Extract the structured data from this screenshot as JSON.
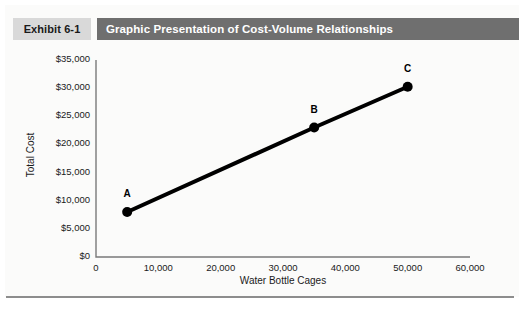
{
  "exhibit": {
    "tag": "Exhibit 6-1",
    "title": "Graphic Presentation of Cost-Volume Relationships"
  },
  "colors": {
    "panel_background": "#fbfbfa",
    "tag_background": "#d9d9d9",
    "title_background": "#6f6f6f",
    "title_text": "#ffffff",
    "axis_line": "#7a7a7a",
    "series_line": "#000000",
    "marker": "#000000",
    "bottom_rule": "#8d8d8d"
  },
  "chart_data": {
    "type": "line",
    "title": "Graphic Presentation of Cost-Volume Relationships",
    "xlabel": "Water Bottle Cages",
    "ylabel": "Total Cost",
    "xlim": [
      0,
      60000
    ],
    "ylim": [
      0,
      35000
    ],
    "xticks": [
      0,
      10000,
      20000,
      30000,
      40000,
      50000,
      60000
    ],
    "xtick_labels": [
      "0",
      "10,000",
      "20,000",
      "30,000",
      "40,000",
      "50,000",
      "60,000"
    ],
    "yticks": [
      0,
      5000,
      10000,
      15000,
      20000,
      25000,
      30000,
      35000
    ],
    "ytick_labels": [
      "$0",
      "$5,000",
      "$10,000",
      "$15,000",
      "$20,000",
      "$25,000",
      "$30,000",
      "$35,000"
    ],
    "grid": false,
    "legend": "none",
    "series": [
      {
        "name": "Total Cost",
        "x": [
          5000,
          35000,
          50000
        ],
        "values": [
          8000,
          23000,
          30250
        ],
        "point_labels": [
          "A",
          "B",
          "C"
        ],
        "line_width": 4,
        "marker": "circle",
        "marker_size": 7
      }
    ],
    "annotations": [
      {
        "text": "A",
        "x": 5000,
        "y": 8000
      },
      {
        "text": "B",
        "x": 35000,
        "y": 23000
      },
      {
        "text": "C",
        "x": 50000,
        "y": 30250
      }
    ]
  }
}
